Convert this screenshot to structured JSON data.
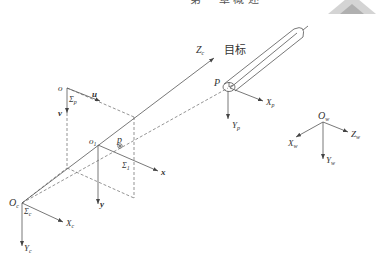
{
  "header": {
    "clipped_title_glyphs": "第 一 章 概 述"
  },
  "labels": {
    "target": "目标",
    "camera_origin": {
      "main": "O",
      "sub": "c"
    },
    "camera_frame": {
      "main": "Σ",
      "sub": "c"
    },
    "camera_x": {
      "main": "X",
      "sub": "c"
    },
    "camera_y": {
      "main": "Y",
      "sub": "c"
    },
    "camera_z": {
      "main": "Z",
      "sub": "c"
    },
    "pixel_origin": "o",
    "pixel_frame": {
      "main": "Σ",
      "sub": "p"
    },
    "pixel_u": "u",
    "pixel_v": "v",
    "image_origin": {
      "main": "o",
      "sub": "1"
    },
    "image_frame": {
      "main": "Σ",
      "sub": "1"
    },
    "image_x": "x",
    "image_y": "y",
    "image_point": "p",
    "target_point": "P",
    "target_x": {
      "main": "X",
      "sub": "p"
    },
    "target_y": {
      "main": "Y",
      "sub": "p"
    },
    "world_origin": {
      "main": "O",
      "sub": "w"
    },
    "world_x": {
      "main": "X",
      "sub": "w"
    },
    "world_y": {
      "main": "Y",
      "sub": "w"
    },
    "world_z": {
      "main": "Z",
      "sub": "w"
    }
  },
  "colors": {
    "line": "#555555",
    "dash": "#666666",
    "text": "#333333",
    "watermark": "#c8c8c8"
  }
}
